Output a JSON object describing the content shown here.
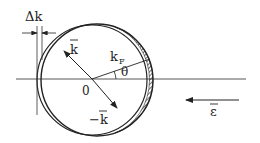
{
  "diagram": {
    "labels": {
      "delta_k": "Δk",
      "k_vec": "k",
      "neg_k_vec": "−k",
      "k_fermi_main": "k",
      "k_fermi_sub": "F",
      "theta": "θ",
      "origin": "0",
      "field": "ε"
    },
    "geometry": {
      "center": [
        95,
        80
      ],
      "radius": 56,
      "shift": 5
    },
    "colors": {
      "stroke": "#222222",
      "background": "#ffffff"
    }
  }
}
